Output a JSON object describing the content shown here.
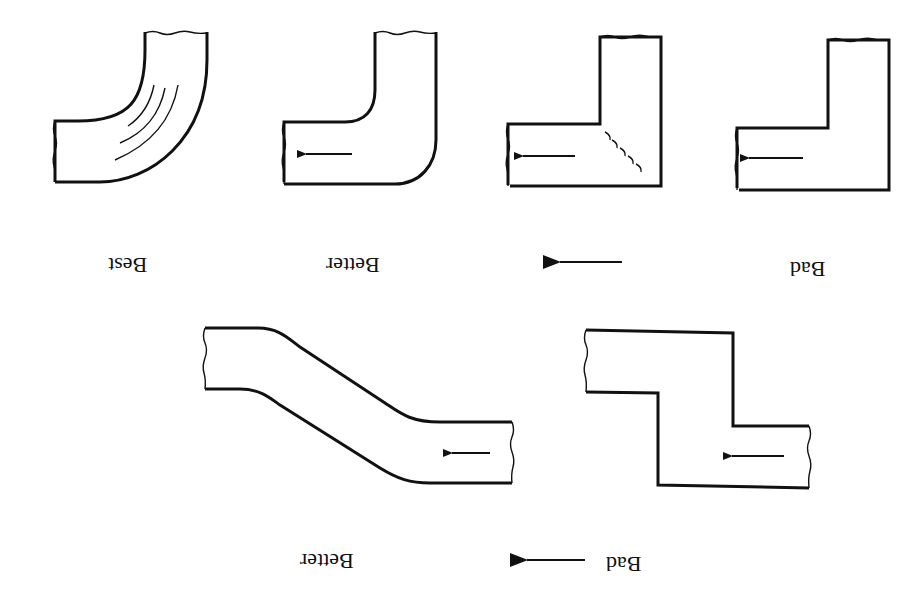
{
  "figure": {
    "orientation": "rotated 180 degrees",
    "top_row": {
      "labels": [
        "Best",
        "Better",
        "Bad"
      ],
      "direction_arrow": "left",
      "elbows": [
        {
          "id": "elbow-best",
          "type": "smooth radius elbow with curved turning vanes"
        },
        {
          "id": "elbow-better",
          "type": "rounded outer corner elbow"
        },
        {
          "id": "elbow-mitered-vanes",
          "type": "square mitered elbow with turning vanes"
        },
        {
          "id": "elbow-bad",
          "type": "square mitered elbow"
        }
      ]
    },
    "bottom_row": {
      "labels": [
        "Better",
        "Bad"
      ],
      "direction_arrow": "left",
      "offsets": [
        {
          "id": "offset-better",
          "type": "gradual angled offset"
        },
        {
          "id": "offset-bad",
          "type": "abrupt square offset"
        }
      ]
    }
  }
}
